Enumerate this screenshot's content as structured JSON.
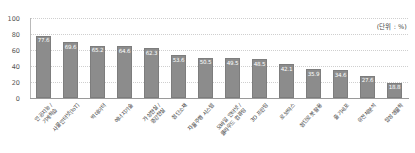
{
  "chart_data": {
    "type": "bar",
    "title": "",
    "subtitle": "",
    "unit_note": "(단위 : %)",
    "xlabel": "",
    "ylabel": "",
    "ylim": [
      0,
      100
    ],
    "yticks": [
      0,
      20,
      40,
      60,
      80,
      100
    ],
    "grid": true,
    "legend": "none",
    "orientation": "vertical",
    "bar_color": "#8c8c8c",
    "categories": [
      "인공지능 /\n기계학습",
      "사물인터넷(IoT)",
      "빅데이터",
      "에너지기술",
      "가상현실 /\n증강현실",
      "첨단소재",
      "자율주행 시스템",
      "모바일 인터넷 /\n클라우드 컴퓨팅",
      "3D 프린팅",
      "로보틱스",
      "첨단로봇 활용",
      "줄기세포",
      "유전체분석",
      "합성생물학"
    ],
    "values": [
      77.6,
      69.6,
      65.2,
      64.6,
      62.3,
      53.6,
      50.5,
      49.5,
      48.5,
      42.1,
      35.9,
      34.6,
      27.6,
      18.8
    ],
    "series": [
      {
        "name": "비중",
        "values": [
          77.6,
          69.6,
          65.2,
          64.6,
          62.3,
          53.6,
          50.5,
          49.5,
          48.5,
          42.1,
          35.9,
          34.6,
          27.6,
          18.8
        ]
      }
    ]
  }
}
